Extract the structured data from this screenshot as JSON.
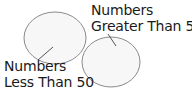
{
  "diagram": {
    "type": "two-set labeled ovals",
    "sets": [
      {
        "id": "left",
        "label_line1": "Numbers",
        "label_line2": "Less Than 50",
        "ellipse": {
          "cx": 55,
          "cy": 38,
          "rx": 31,
          "ry": 26
        },
        "leader": {
          "x1": 38,
          "y1": 60,
          "x2": 53,
          "y2": 47
        }
      },
      {
        "id": "right",
        "label_line1": "Numbers",
        "label_line2": "Greater Than 50",
        "ellipse": {
          "cx": 111,
          "cy": 62,
          "rx": 29,
          "ry": 25
        },
        "leader": {
          "x1": 108,
          "y1": 34,
          "x2": 116,
          "y2": 46
        }
      }
    ],
    "colors": {
      "stroke": "#8a8a8a",
      "fill": "#f7f7f7",
      "text": "#1a1a1a",
      "background": "#ffffff"
    }
  }
}
